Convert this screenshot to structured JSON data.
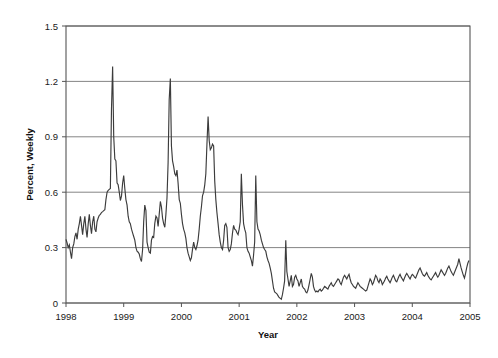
{
  "figure": {
    "background": "#ffffff",
    "plot_background": "#ffffff"
  },
  "axis": {
    "y_title": "Percent, Weekly",
    "x_title": "Year",
    "y_ticks": [
      "0",
      "0.3",
      "0.6",
      "0.9",
      "1.2",
      "1.5"
    ],
    "x_ticks": [
      "1998",
      "1999",
      "2000",
      "2001",
      "2002",
      "2003",
      "2004",
      "2005"
    ]
  },
  "style": {
    "line_color": "#3c3c3c",
    "grid_color": "#777777",
    "frame_color": "#555555",
    "text_color": "#1a1a1a"
  },
  "chart_data": {
    "type": "line",
    "title": "",
    "subtitle": "",
    "xlabel": "Year",
    "ylabel": "Percent, Weekly",
    "xlim": [
      1998.0,
      2005.0
    ],
    "ylim": [
      0,
      1.5
    ],
    "yticks": [
      0,
      0.3,
      0.6,
      0.9,
      1.2,
      1.5
    ],
    "xticks": [
      1998,
      1999,
      2000,
      2001,
      2002,
      2003,
      2004,
      2005
    ],
    "grid": "horizontal",
    "legend": "none",
    "annotations": [],
    "series": [
      {
        "name": "Percent, Weekly",
        "x": [
          1998.0,
          1998.019,
          1998.038,
          1998.058,
          1998.077,
          1998.096,
          1998.115,
          1998.135,
          1998.154,
          1998.173,
          1998.192,
          1998.212,
          1998.231,
          1998.25,
          1998.269,
          1998.288,
          1998.308,
          1998.327,
          1998.346,
          1998.365,
          1998.385,
          1998.404,
          1998.423,
          1998.442,
          1998.462,
          1998.481,
          1998.5,
          1998.519,
          1998.538,
          1998.558,
          1998.577,
          1998.596,
          1998.615,
          1998.635,
          1998.654,
          1998.673,
          1998.692,
          1998.712,
          1998.731,
          1998.75,
          1998.769,
          1998.788,
          1998.808,
          1998.827,
          1998.846,
          1998.865,
          1998.885,
          1998.904,
          1998.923,
          1998.942,
          1998.962,
          1998.981,
          1999.0,
          1999.019,
          1999.038,
          1999.058,
          1999.077,
          1999.096,
          1999.115,
          1999.135,
          1999.154,
          1999.173,
          1999.192,
          1999.212,
          1999.231,
          1999.25,
          1999.269,
          1999.288,
          1999.308,
          1999.327,
          1999.346,
          1999.365,
          1999.385,
          1999.404,
          1999.423,
          1999.442,
          1999.462,
          1999.481,
          1999.5,
          1999.519,
          1999.538,
          1999.558,
          1999.577,
          1999.596,
          1999.615,
          1999.635,
          1999.654,
          1999.673,
          1999.692,
          1999.712,
          1999.731,
          1999.75,
          1999.769,
          1999.788,
          1999.808,
          1999.827,
          1999.846,
          1999.865,
          1999.885,
          1999.904,
          1999.923,
          1999.942,
          1999.962,
          1999.981,
          2000.0,
          2000.019,
          2000.038,
          2000.058,
          2000.077,
          2000.096,
          2000.115,
          2000.135,
          2000.154,
          2000.173,
          2000.192,
          2000.212,
          2000.231,
          2000.25,
          2000.269,
          2000.288,
          2000.308,
          2000.327,
          2000.346,
          2000.365,
          2000.385,
          2000.404,
          2000.423,
          2000.442,
          2000.462,
          2000.481,
          2000.5,
          2000.519,
          2000.538,
          2000.558,
          2000.577,
          2000.596,
          2000.615,
          2000.635,
          2000.654,
          2000.673,
          2000.692,
          2000.712,
          2000.731,
          2000.75,
          2000.769,
          2000.788,
          2000.808,
          2000.827,
          2000.846,
          2000.865,
          2000.885,
          2000.904,
          2000.923,
          2000.942,
          2000.962,
          2000.981,
          2001.0,
          2001.019,
          2001.038,
          2001.058,
          2001.077,
          2001.096,
          2001.115,
          2001.135,
          2001.154,
          2001.173,
          2001.192,
          2001.212,
          2001.231,
          2001.25,
          2001.269,
          2001.288,
          2001.308,
          2001.327,
          2001.346,
          2001.365,
          2001.385,
          2001.404,
          2001.423,
          2001.442,
          2001.462,
          2001.481,
          2001.5,
          2001.519,
          2001.538,
          2001.558,
          2001.577,
          2001.596,
          2001.615,
          2001.635,
          2001.654,
          2001.673,
          2001.692,
          2001.712,
          2001.731,
          2001.75,
          2001.769,
          2001.788,
          2001.808,
          2001.827,
          2001.846,
          2001.865,
          2001.885,
          2001.904,
          2001.923,
          2001.942,
          2001.962,
          2001.981,
          2002.0,
          2002.019,
          2002.038,
          2002.058,
          2002.077,
          2002.096,
          2002.115,
          2002.135,
          2002.154,
          2002.173,
          2002.192,
          2002.212,
          2002.231,
          2002.25,
          2002.269,
          2002.288,
          2002.308,
          2002.327,
          2002.346,
          2002.365,
          2002.385,
          2002.404,
          2002.423,
          2002.442,
          2002.462,
          2002.481,
          2002.5,
          2002.519,
          2002.538,
          2002.558,
          2002.577,
          2002.596,
          2002.615,
          2002.635,
          2002.654,
          2002.673,
          2002.692,
          2002.712,
          2002.731,
          2002.75,
          2002.769,
          2002.788,
          2002.808,
          2002.827,
          2002.846,
          2002.865,
          2002.885,
          2002.904,
          2002.923,
          2002.942,
          2002.962,
          2002.981,
          2003.0,
          2003.019,
          2003.038,
          2003.058,
          2003.077,
          2003.096,
          2003.115,
          2003.135,
          2003.154,
          2003.173,
          2003.192,
          2003.212,
          2003.231,
          2003.25,
          2003.269,
          2003.288,
          2003.308,
          2003.327,
          2003.346,
          2003.365,
          2003.385,
          2003.404,
          2003.423,
          2003.442,
          2003.462,
          2003.481,
          2003.5,
          2003.519,
          2003.538,
          2003.558,
          2003.577,
          2003.596,
          2003.615,
          2003.635,
          2003.654,
          2003.673,
          2003.692,
          2003.712,
          2003.731,
          2003.75,
          2003.769,
          2003.788,
          2003.808,
          2003.827,
          2003.846,
          2003.865,
          2003.885,
          2003.904,
          2003.923,
          2003.942,
          2003.962,
          2003.981,
          2004.0,
          2004.019,
          2004.038,
          2004.058,
          2004.077,
          2004.096,
          2004.115,
          2004.135,
          2004.154,
          2004.173,
          2004.192,
          2004.212,
          2004.231,
          2004.25,
          2004.269,
          2004.288,
          2004.308,
          2004.327,
          2004.346,
          2004.365,
          2004.385,
          2004.404,
          2004.423,
          2004.442,
          2004.462,
          2004.481,
          2004.5,
          2004.519,
          2004.538,
          2004.558,
          2004.577,
          2004.596,
          2004.615,
          2004.635,
          2004.654,
          2004.673,
          2004.692,
          2004.712,
          2004.731,
          2004.75,
          2004.769,
          2004.788,
          2004.808,
          2004.827,
          2004.846,
          2004.865,
          2004.885,
          2004.904,
          2004.923,
          2004.942,
          2004.962,
          2004.981
        ],
        "values": [
          0.345,
          0.325,
          0.3,
          0.315,
          0.275,
          0.24,
          0.3,
          0.32,
          0.36,
          0.38,
          0.345,
          0.4,
          0.43,
          0.47,
          0.42,
          0.37,
          0.43,
          0.47,
          0.4,
          0.355,
          0.43,
          0.48,
          0.42,
          0.375,
          0.44,
          0.47,
          0.4,
          0.385,
          0.44,
          0.46,
          0.475,
          0.48,
          0.49,
          0.495,
          0.5,
          0.505,
          0.56,
          0.6,
          0.61,
          0.615,
          0.62,
          1.05,
          1.28,
          0.9,
          0.78,
          0.77,
          0.65,
          0.64,
          0.6,
          0.555,
          0.58,
          0.65,
          0.69,
          0.62,
          0.56,
          0.53,
          0.47,
          0.44,
          0.43,
          0.4,
          0.38,
          0.36,
          0.34,
          0.3,
          0.28,
          0.275,
          0.265,
          0.24,
          0.225,
          0.29,
          0.44,
          0.53,
          0.5,
          0.33,
          0.3,
          0.275,
          0.27,
          0.34,
          0.36,
          0.355,
          0.43,
          0.47,
          0.46,
          0.415,
          0.48,
          0.55,
          0.52,
          0.46,
          0.43,
          0.41,
          0.48,
          0.57,
          0.76,
          1.1,
          1.215,
          0.85,
          0.77,
          0.74,
          0.7,
          0.69,
          0.72,
          0.65,
          0.56,
          0.54,
          0.48,
          0.43,
          0.4,
          0.38,
          0.35,
          0.3,
          0.27,
          0.25,
          0.23,
          0.245,
          0.29,
          0.33,
          0.3,
          0.29,
          0.31,
          0.34,
          0.4,
          0.47,
          0.52,
          0.58,
          0.6,
          0.64,
          0.7,
          0.86,
          1.01,
          0.88,
          0.83,
          0.84,
          0.86,
          0.85,
          0.66,
          0.56,
          0.49,
          0.43,
          0.37,
          0.33,
          0.3,
          0.29,
          0.34,
          0.42,
          0.43,
          0.41,
          0.3,
          0.28,
          0.29,
          0.32,
          0.38,
          0.42,
          0.4,
          0.395,
          0.38,
          0.37,
          0.4,
          0.44,
          0.7,
          0.53,
          0.43,
          0.4,
          0.38,
          0.3,
          0.28,
          0.27,
          0.25,
          0.23,
          0.2,
          0.26,
          0.33,
          0.69,
          0.44,
          0.4,
          0.39,
          0.37,
          0.34,
          0.32,
          0.3,
          0.29,
          0.28,
          0.25,
          0.23,
          0.215,
          0.19,
          0.16,
          0.12,
          0.08,
          0.06,
          0.055,
          0.05,
          0.04,
          0.03,
          0.025,
          0.02,
          0.045,
          0.08,
          0.12,
          0.34,
          0.17,
          0.13,
          0.09,
          0.12,
          0.15,
          0.09,
          0.1,
          0.14,
          0.15,
          0.13,
          0.12,
          0.09,
          0.11,
          0.13,
          0.09,
          0.08,
          0.075,
          0.06,
          0.055,
          0.07,
          0.1,
          0.13,
          0.16,
          0.14,
          0.09,
          0.07,
          0.06,
          0.065,
          0.06,
          0.07,
          0.075,
          0.065,
          0.07,
          0.08,
          0.09,
          0.085,
          0.08,
          0.075,
          0.09,
          0.1,
          0.11,
          0.095,
          0.09,
          0.1,
          0.11,
          0.12,
          0.13,
          0.125,
          0.11,
          0.1,
          0.12,
          0.14,
          0.15,
          0.14,
          0.13,
          0.145,
          0.155,
          0.13,
          0.11,
          0.1,
          0.09,
          0.085,
          0.08,
          0.095,
          0.11,
          0.1,
          0.09,
          0.085,
          0.08,
          0.075,
          0.07,
          0.065,
          0.07,
          0.09,
          0.11,
          0.13,
          0.12,
          0.1,
          0.11,
          0.13,
          0.15,
          0.14,
          0.12,
          0.11,
          0.13,
          0.12,
          0.1,
          0.11,
          0.12,
          0.135,
          0.145,
          0.13,
          0.12,
          0.11,
          0.125,
          0.14,
          0.15,
          0.135,
          0.12,
          0.115,
          0.13,
          0.145,
          0.155,
          0.14,
          0.13,
          0.12,
          0.135,
          0.15,
          0.16,
          0.15,
          0.14,
          0.13,
          0.145,
          0.155,
          0.15,
          0.14,
          0.135,
          0.15,
          0.165,
          0.18,
          0.19,
          0.175,
          0.16,
          0.15,
          0.145,
          0.155,
          0.165,
          0.15,
          0.14,
          0.13,
          0.125,
          0.135,
          0.145,
          0.155,
          0.165,
          0.15,
          0.14,
          0.15,
          0.165,
          0.18,
          0.17,
          0.16,
          0.15,
          0.16,
          0.175,
          0.19,
          0.2,
          0.185,
          0.17,
          0.16,
          0.15,
          0.165,
          0.18,
          0.195,
          0.21,
          0.24,
          0.215,
          0.19,
          0.17,
          0.15,
          0.135,
          0.16,
          0.19,
          0.215,
          0.23
        ]
      }
    ]
  }
}
